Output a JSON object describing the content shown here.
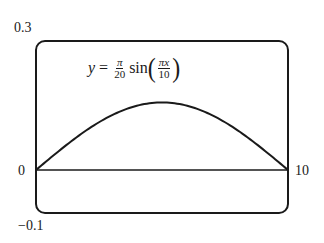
{
  "chart_data": {
    "type": "line",
    "equation": {
      "lhs": "y",
      "coef_num": "π",
      "coef_den": "20",
      "func": "sin",
      "arg_num": "πx",
      "arg_den": "10"
    },
    "xlabel": "",
    "ylabel": "",
    "xlim": [
      0,
      10
    ],
    "ylim": [
      -0.1,
      0.3
    ],
    "tick_labels": {
      "x_left": "0",
      "x_right": "10",
      "y_top": "0.3",
      "y_bottom": "−0.1"
    },
    "grid": false,
    "series": [
      {
        "name": "y = (π/20) sin(πx/10)",
        "x": [
          0,
          1,
          2,
          3,
          4,
          5,
          6,
          7,
          8,
          9,
          10
        ],
        "values": [
          0,
          0.0485,
          0.0923,
          0.1271,
          0.1494,
          0.1571,
          0.1494,
          0.1271,
          0.0923,
          0.0485,
          0
        ]
      }
    ]
  }
}
